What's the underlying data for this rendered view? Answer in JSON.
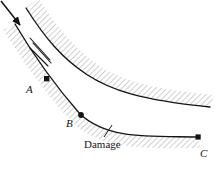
{
  "figure": {
    "type": "technical-line-diagram",
    "background_color": "#ffffff",
    "line_color": "#141414",
    "hatch_color": "#9a9a9a",
    "labels": {
      "point_a": "A",
      "point_b": "B",
      "point_c": "C",
      "damage": "Damage"
    },
    "markers": [
      {
        "name": "A",
        "shape": "square",
        "x": 47,
        "y": 79
      },
      {
        "name": "B",
        "shape": "circle",
        "x": 81,
        "y": 115
      },
      {
        "name": "C",
        "shape": "square",
        "x": 198,
        "y": 137
      }
    ],
    "curves": [
      {
        "name": "upper-curve",
        "path": "M 26,8 C 45,38 62,58 86,74 C 110,90 140,100 210,107"
      },
      {
        "name": "lower-curve",
        "path": "M 15,24 C 34,56 52,82 80,114 C 108,140 150,136 198,137"
      }
    ],
    "arrow": {
      "name": "flow-direction-arrow",
      "from_x": 2,
      "from_y": 2,
      "to_x": 21,
      "to_y": 26
    },
    "flow_ticks": {
      "name": "flow-tick-marks",
      "count": 3
    },
    "leader_line": {
      "name": "damage-leader-line",
      "from_x": 104,
      "from_y": 136,
      "to_x": 111,
      "to_y": 126
    }
  }
}
